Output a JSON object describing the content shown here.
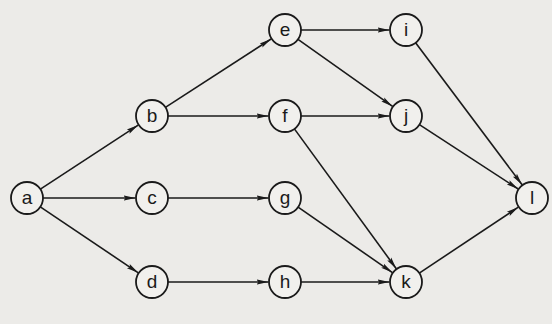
{
  "diagram": {
    "type": "directed-graph",
    "colors": {
      "background": "#ecebe8",
      "stroke": "#1a1a1a",
      "node_fill": "#f1f0ed"
    },
    "node_radius": 16,
    "nodes": [
      {
        "id": "a",
        "label": "a",
        "x": 27,
        "y": 198
      },
      {
        "id": "b",
        "label": "b",
        "x": 152,
        "y": 116
      },
      {
        "id": "c",
        "label": "c",
        "x": 152,
        "y": 198
      },
      {
        "id": "d",
        "label": "d",
        "x": 152,
        "y": 282
      },
      {
        "id": "e",
        "label": "e",
        "x": 285,
        "y": 30
      },
      {
        "id": "f",
        "label": "f",
        "x": 285,
        "y": 116
      },
      {
        "id": "g",
        "label": "g",
        "x": 285,
        "y": 198
      },
      {
        "id": "h",
        "label": "h",
        "x": 285,
        "y": 282
      },
      {
        "id": "i",
        "label": "i",
        "x": 406,
        "y": 30
      },
      {
        "id": "j",
        "label": "j",
        "x": 406,
        "y": 116
      },
      {
        "id": "k",
        "label": "k",
        "x": 406,
        "y": 282
      },
      {
        "id": "l",
        "label": "l",
        "x": 532,
        "y": 198
      }
    ],
    "edges": [
      {
        "from": "a",
        "to": "b"
      },
      {
        "from": "a",
        "to": "c"
      },
      {
        "from": "a",
        "to": "d"
      },
      {
        "from": "b",
        "to": "e"
      },
      {
        "from": "b",
        "to": "f"
      },
      {
        "from": "c",
        "to": "g"
      },
      {
        "from": "d",
        "to": "h"
      },
      {
        "from": "e",
        "to": "i"
      },
      {
        "from": "e",
        "to": "j"
      },
      {
        "from": "f",
        "to": "j"
      },
      {
        "from": "f",
        "to": "k"
      },
      {
        "from": "g",
        "to": "k"
      },
      {
        "from": "h",
        "to": "k"
      },
      {
        "from": "i",
        "to": "l"
      },
      {
        "from": "j",
        "to": "l"
      },
      {
        "from": "k",
        "to": "l"
      }
    ]
  }
}
